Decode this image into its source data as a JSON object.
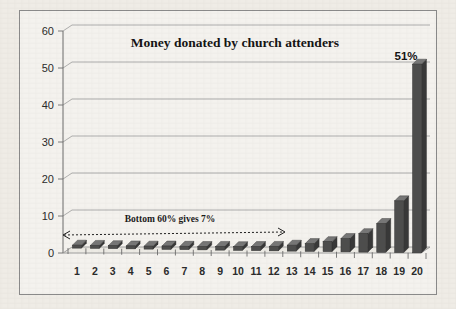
{
  "chart_data": {
    "type": "bar",
    "title": "Money donated by church attenders",
    "xlabel": "",
    "ylabel": "",
    "ylim": [
      0,
      60
    ],
    "yticks": [
      0,
      10,
      20,
      30,
      40,
      50,
      60
    ],
    "grid": true,
    "legend": "none",
    "categories": [
      "1",
      "2",
      "3",
      "4",
      "5",
      "6",
      "7",
      "8",
      "9",
      "10",
      "11",
      "12",
      "13",
      "14",
      "15",
      "16",
      "17",
      "18",
      "19",
      "20"
    ],
    "values": [
      0.8,
      0.8,
      0.8,
      0.8,
      0.8,
      0.9,
      0.9,
      0.9,
      1.0,
      1.0,
      1.1,
      1.2,
      1.6,
      2.1,
      2.7,
      3.6,
      5.0,
      7.8,
      14.0,
      51.0
    ],
    "data_labels": [
      {
        "category": "20",
        "text": "51%"
      }
    ],
    "annotations": [
      {
        "name": "bottom-60-annotation",
        "text": "Bottom 60% gives 7%",
        "arrow": "double",
        "from_category": "1",
        "to_category": "12"
      }
    ],
    "colors": {
      "bar": "#4d4d4d",
      "bar_top": "#777777",
      "bar_side": "#383838",
      "grid": "#9a9a9a",
      "axis": "#6d6d6d",
      "background": "#f4f2ee",
      "text": "#141414"
    }
  }
}
